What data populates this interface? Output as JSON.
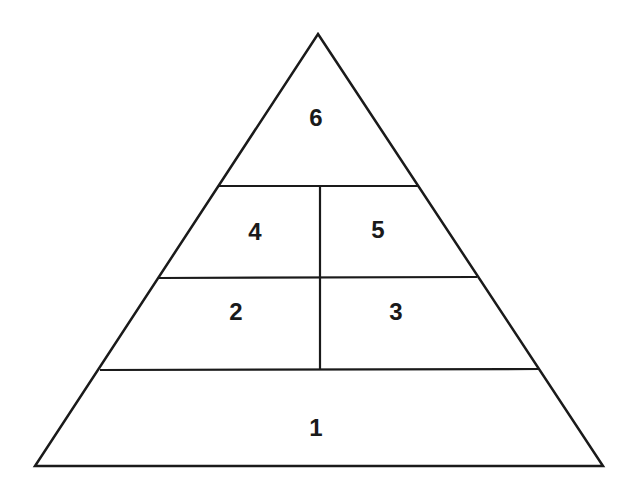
{
  "diagram": {
    "type": "pyramid",
    "line_color": "#1a1a1a",
    "background": "#ffffff",
    "tiers": [
      {
        "level": 1,
        "sections": [
          {
            "label": "1"
          }
        ]
      },
      {
        "level": 2,
        "sections": [
          {
            "label": "2"
          },
          {
            "label": "3"
          }
        ]
      },
      {
        "level": 3,
        "sections": [
          {
            "label": "4"
          },
          {
            "label": "5"
          }
        ]
      },
      {
        "level": 4,
        "sections": [
          {
            "label": "6"
          }
        ]
      }
    ],
    "labels": {
      "tier_1": "1",
      "tier_2_left": "2",
      "tier_2_right": "3",
      "tier_3_left": "4",
      "tier_3_right": "5",
      "tier_4": "6"
    }
  }
}
